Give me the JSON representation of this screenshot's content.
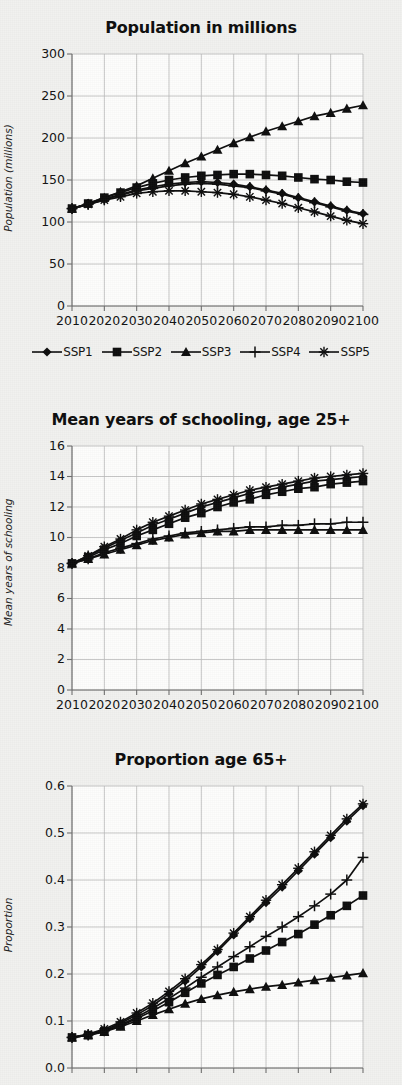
{
  "figure": {
    "background_color": "#f1f1ef",
    "ink_color": "#0d0d0d",
    "grid_color": "#b9b9b9",
    "axis_color": "#6e6e6e"
  },
  "legend": {
    "position": "below-chart-1",
    "items": [
      {
        "label": "SSP1",
        "marker": "diamond"
      },
      {
        "label": "SSP2",
        "marker": "square"
      },
      {
        "label": "SSP3",
        "marker": "triangle"
      },
      {
        "label": "SSP4",
        "marker": "plus"
      },
      {
        "label": "SSP5",
        "marker": "asterisk"
      }
    ]
  },
  "chart_data": [
    {
      "type": "line",
      "title": "Population in millions",
      "xlabel": "",
      "ylabel": "Population (millions)",
      "x": [
        2010,
        2020,
        2030,
        2040,
        2050,
        2060,
        2070,
        2080,
        2090,
        2100
      ],
      "xtick_labels": [
        "2010",
        "2020",
        "2030",
        "2040",
        "2050",
        "2060",
        "2070",
        "2080",
        "2090",
        "2100"
      ],
      "xlim": [
        2010,
        2100
      ],
      "ylim": [
        0,
        300
      ],
      "ytick_labels": [
        "0",
        "50",
        "100",
        "150",
        "200",
        "250",
        "300"
      ],
      "yticks": [
        0,
        50,
        100,
        150,
        200,
        250,
        300
      ],
      "grid": true,
      "marker_every": 5,
      "series": [
        {
          "name": "SSP1",
          "marker": "diamond",
          "x": [
            2010,
            2015,
            2020,
            2025,
            2030,
            2035,
            2040,
            2045,
            2050,
            2055,
            2060,
            2065,
            2070,
            2075,
            2080,
            2085,
            2090,
            2095,
            2100
          ],
          "values": [
            116,
            121,
            127,
            133,
            138,
            142,
            145,
            147,
            148,
            147,
            145,
            142,
            138,
            134,
            129,
            124,
            119,
            114,
            110
          ]
        },
        {
          "name": "SSP2",
          "marker": "square",
          "x": [
            2010,
            2015,
            2020,
            2025,
            2030,
            2035,
            2040,
            2045,
            2050,
            2055,
            2060,
            2065,
            2070,
            2075,
            2080,
            2085,
            2090,
            2095,
            2100
          ],
          "values": [
            116,
            122,
            129,
            135,
            141,
            146,
            150,
            153,
            155,
            156,
            157,
            157,
            156,
            155,
            153,
            151,
            150,
            148,
            147
          ]
        },
        {
          "name": "SSP3",
          "marker": "triangle",
          "x": [
            2010,
            2015,
            2020,
            2025,
            2030,
            2035,
            2040,
            2045,
            2050,
            2055,
            2060,
            2065,
            2070,
            2075,
            2080,
            2085,
            2090,
            2095,
            2100
          ],
          "values": [
            116,
            122,
            129,
            136,
            143,
            152,
            161,
            170,
            178,
            186,
            194,
            201,
            208,
            214,
            220,
            226,
            230,
            235,
            239
          ]
        },
        {
          "name": "SSP4",
          "marker": "plus",
          "x": [
            2010,
            2015,
            2020,
            2025,
            2030,
            2035,
            2040,
            2045,
            2050,
            2055,
            2060,
            2065,
            2070,
            2075,
            2080,
            2085,
            2090,
            2095,
            2100
          ],
          "values": [
            116,
            121,
            127,
            132,
            137,
            140,
            143,
            145,
            146,
            145,
            143,
            141,
            137,
            133,
            128,
            123,
            118,
            113,
            109
          ]
        },
        {
          "name": "SSP5",
          "marker": "asterisk",
          "x": [
            2010,
            2015,
            2020,
            2025,
            2030,
            2035,
            2040,
            2045,
            2050,
            2055,
            2060,
            2065,
            2070,
            2075,
            2080,
            2085,
            2090,
            2095,
            2100
          ],
          "values": [
            116,
            121,
            126,
            130,
            134,
            136,
            137,
            137,
            136,
            135,
            133,
            130,
            126,
            122,
            117,
            112,
            107,
            102,
            98
          ]
        }
      ]
    },
    {
      "type": "line",
      "title": "Mean years of schooling, age 25+",
      "xlabel": "",
      "ylabel": "Mean years of schooling",
      "x": [
        2010,
        2020,
        2030,
        2040,
        2050,
        2060,
        2070,
        2080,
        2090,
        2100
      ],
      "xtick_labels": [
        "2010",
        "2020",
        "2030",
        "2040",
        "2050",
        "2060",
        "2070",
        "2080",
        "2090",
        "2100"
      ],
      "xlim": [
        2010,
        2100
      ],
      "ylim": [
        0,
        16
      ],
      "ytick_labels": [
        "0",
        "2",
        "4",
        "6",
        "8",
        "10",
        "12",
        "14",
        "16"
      ],
      "yticks": [
        0,
        2,
        4,
        6,
        8,
        10,
        12,
        14,
        16
      ],
      "grid": true,
      "marker_every": 5,
      "series": [
        {
          "name": "SSP1",
          "marker": "diamond",
          "x": [
            2010,
            2015,
            2020,
            2025,
            2030,
            2035,
            2040,
            2045,
            2050,
            2055,
            2060,
            2065,
            2070,
            2075,
            2080,
            2085,
            2090,
            2095,
            2100
          ],
          "values": [
            8.3,
            8.8,
            9.3,
            9.8,
            10.3,
            10.8,
            11.2,
            11.6,
            12.0,
            12.3,
            12.6,
            12.9,
            13.1,
            13.3,
            13.5,
            13.7,
            13.8,
            13.9,
            14.0
          ]
        },
        {
          "name": "SSP2",
          "marker": "square",
          "x": [
            2010,
            2015,
            2020,
            2025,
            2030,
            2035,
            2040,
            2045,
            2050,
            2055,
            2060,
            2065,
            2070,
            2075,
            2080,
            2085,
            2090,
            2095,
            2100
          ],
          "values": [
            8.3,
            8.7,
            9.2,
            9.6,
            10.1,
            10.5,
            10.9,
            11.3,
            11.6,
            12.0,
            12.3,
            12.5,
            12.8,
            13.0,
            13.2,
            13.3,
            13.5,
            13.6,
            13.7
          ]
        },
        {
          "name": "SSP3",
          "marker": "triangle",
          "x": [
            2010,
            2015,
            2020,
            2025,
            2030,
            2035,
            2040,
            2045,
            2050,
            2055,
            2060,
            2065,
            2070,
            2075,
            2080,
            2085,
            2090,
            2095,
            2100
          ],
          "values": [
            8.3,
            8.6,
            8.9,
            9.2,
            9.5,
            9.8,
            10.0,
            10.2,
            10.3,
            10.4,
            10.4,
            10.5,
            10.5,
            10.5,
            10.5,
            10.5,
            10.5,
            10.5,
            10.5
          ]
        },
        {
          "name": "SSP4",
          "marker": "plus",
          "x": [
            2010,
            2015,
            2020,
            2025,
            2030,
            2035,
            2040,
            2045,
            2050,
            2055,
            2060,
            2065,
            2070,
            2075,
            2080,
            2085,
            2090,
            2095,
            2100
          ],
          "values": [
            8.3,
            8.6,
            9.0,
            9.3,
            9.6,
            9.9,
            10.1,
            10.3,
            10.4,
            10.5,
            10.6,
            10.7,
            10.7,
            10.8,
            10.8,
            10.9,
            10.9,
            11.0,
            11.0
          ]
        },
        {
          "name": "SSP5",
          "marker": "asterisk",
          "x": [
            2010,
            2015,
            2020,
            2025,
            2030,
            2035,
            2040,
            2045,
            2050,
            2055,
            2060,
            2065,
            2070,
            2075,
            2080,
            2085,
            2090,
            2095,
            2100
          ],
          "values": [
            8.3,
            8.8,
            9.4,
            9.9,
            10.5,
            11.0,
            11.4,
            11.8,
            12.2,
            12.5,
            12.8,
            13.1,
            13.3,
            13.5,
            13.7,
            13.9,
            14.0,
            14.1,
            14.2
          ]
        }
      ]
    },
    {
      "type": "line",
      "title": "Proportion age 65+",
      "xlabel": "",
      "ylabel": "Proportion",
      "x": [
        2010,
        2020,
        2030,
        2040,
        2050,
        2060,
        2070,
        2080,
        2090,
        2100
      ],
      "xtick_labels": [],
      "xlim": [
        2010,
        2100
      ],
      "ylim": [
        0.0,
        0.6
      ],
      "ytick_labels": [
        "0.0",
        "0.1",
        "0.2",
        "0.3",
        "0.4",
        "0.5",
        "0.6"
      ],
      "yticks": [
        0.0,
        0.1,
        0.2,
        0.3,
        0.4,
        0.5,
        0.6
      ],
      "grid": true,
      "marker_every": 5,
      "note": "bottom of panel cropped by screenshot edge",
      "series": [
        {
          "name": "SSP1",
          "marker": "diamond",
          "x": [
            2010,
            2015,
            2020,
            2025,
            2030,
            2035,
            2040,
            2045,
            2050,
            2055,
            2060,
            2065,
            2070,
            2075,
            2080,
            2085,
            2090,
            2095,
            2100
          ],
          "values": [
            0.065,
            0.07,
            0.08,
            0.095,
            0.113,
            0.133,
            0.158,
            0.185,
            0.215,
            0.248,
            0.283,
            0.318,
            0.352,
            0.385,
            0.42,
            0.455,
            0.49,
            0.525,
            0.558
          ]
        },
        {
          "name": "SSP2",
          "marker": "square",
          "x": [
            2010,
            2015,
            2020,
            2025,
            2030,
            2035,
            2040,
            2045,
            2050,
            2055,
            2060,
            2065,
            2070,
            2075,
            2080,
            2085,
            2090,
            2095,
            2100
          ],
          "values": [
            0.065,
            0.07,
            0.078,
            0.09,
            0.105,
            0.122,
            0.14,
            0.16,
            0.18,
            0.198,
            0.215,
            0.233,
            0.25,
            0.268,
            0.285,
            0.305,
            0.325,
            0.345,
            0.367
          ]
        },
        {
          "name": "SSP3",
          "marker": "triangle",
          "x": [
            2010,
            2015,
            2020,
            2025,
            2030,
            2035,
            2040,
            2045,
            2050,
            2055,
            2060,
            2065,
            2070,
            2075,
            2080,
            2085,
            2090,
            2095,
            2100
          ],
          "values": [
            0.065,
            0.07,
            0.077,
            0.088,
            0.1,
            0.113,
            0.125,
            0.137,
            0.147,
            0.155,
            0.162,
            0.168,
            0.173,
            0.177,
            0.182,
            0.187,
            0.192,
            0.197,
            0.202
          ]
        },
        {
          "name": "SSP4",
          "marker": "plus",
          "x": [
            2010,
            2015,
            2020,
            2025,
            2030,
            2035,
            2040,
            2045,
            2050,
            2055,
            2060,
            2065,
            2070,
            2075,
            2080,
            2085,
            2090,
            2095,
            2100
          ],
          "values": [
            0.065,
            0.07,
            0.079,
            0.092,
            0.108,
            0.127,
            0.148,
            0.17,
            0.193,
            0.215,
            0.237,
            0.258,
            0.28,
            0.3,
            0.322,
            0.345,
            0.37,
            0.4,
            0.448
          ]
        },
        {
          "name": "SSP5",
          "marker": "asterisk",
          "x": [
            2010,
            2015,
            2020,
            2025,
            2030,
            2035,
            2040,
            2045,
            2050,
            2055,
            2060,
            2065,
            2070,
            2075,
            2080,
            2085,
            2090,
            2095,
            2100
          ],
          "values": [
            0.065,
            0.072,
            0.083,
            0.098,
            0.117,
            0.138,
            0.163,
            0.19,
            0.22,
            0.252,
            0.287,
            0.322,
            0.357,
            0.39,
            0.425,
            0.46,
            0.495,
            0.53,
            0.562
          ]
        }
      ]
    }
  ]
}
